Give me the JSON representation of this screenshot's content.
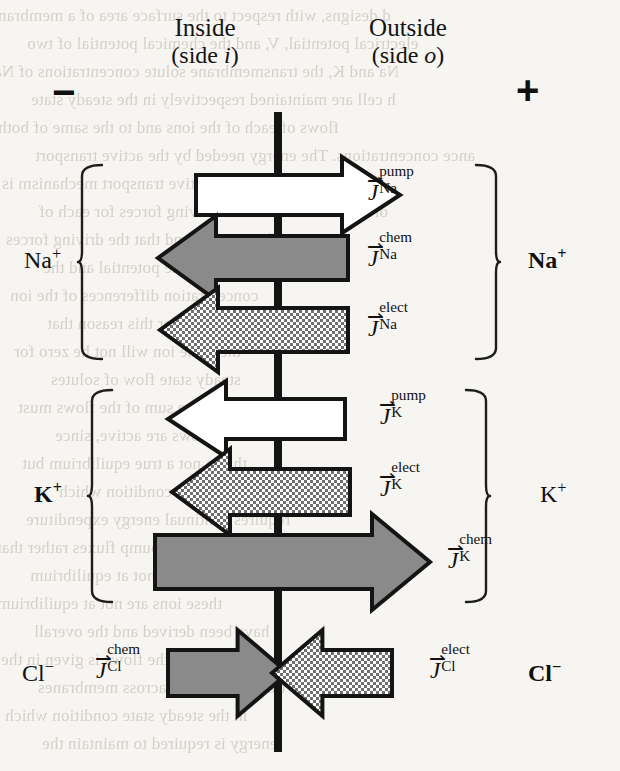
{
  "figure": {
    "type": "membrane-ion-flux-diagram",
    "membrane_color": "#141414",
    "arrow_outline_color": "#141414",
    "fill_pump": "#ffffff",
    "fill_chem": "#8a8a8a",
    "fill_elect": "#8a8a8a",
    "background": "#f7f5f1"
  },
  "header": {
    "inside": {
      "title": "Inside",
      "subtitle_pre": "(side ",
      "subtitle_italic": "i",
      "subtitle_post": ")"
    },
    "outside": {
      "title": "Outside",
      "subtitle_pre": "(side ",
      "subtitle_italic": "o",
      "subtitle_post": ")"
    },
    "inside_charge": "−",
    "outside_charge": "+"
  },
  "groups": [
    {
      "id": "sodium",
      "ion_left": "Na",
      "ion_left_charge": "+",
      "ion_left_bold": false,
      "ion_right": "Na",
      "ion_right_charge": "+",
      "ion_right_bold": true,
      "fluxes": [
        {
          "id": "na-pump",
          "symbol": "J",
          "superscript": "pump",
          "subscript": "Na",
          "style": "pump",
          "direction": "right"
        },
        {
          "id": "na-chem",
          "symbol": "J",
          "superscript": "chem",
          "subscript": "Na",
          "style": "chem",
          "direction": "left"
        },
        {
          "id": "na-elect",
          "symbol": "J",
          "superscript": "elect",
          "subscript": "Na",
          "style": "elect",
          "direction": "left"
        }
      ]
    },
    {
      "id": "potassium",
      "ion_left": "K",
      "ion_left_charge": "+",
      "ion_left_bold": true,
      "ion_right": "K",
      "ion_right_charge": "+",
      "ion_right_bold": false,
      "fluxes": [
        {
          "id": "k-pump",
          "symbol": "J",
          "superscript": "pump",
          "subscript": "K",
          "style": "pump",
          "direction": "left"
        },
        {
          "id": "k-elect",
          "symbol": "J",
          "superscript": "elect",
          "subscript": "K",
          "style": "elect",
          "direction": "left"
        },
        {
          "id": "k-chem",
          "symbol": "J",
          "superscript": "chem",
          "subscript": "K",
          "style": "chem",
          "direction": "right"
        }
      ]
    },
    {
      "id": "chloride",
      "ion_left": "Cl",
      "ion_left_charge": "−",
      "ion_left_bold": false,
      "ion_right": "Cl",
      "ion_right_charge": "−",
      "ion_right_bold": true,
      "fluxes": [
        {
          "id": "cl-chem",
          "symbol": "J",
          "superscript": "chem",
          "subscript": "Cl",
          "style": "chem",
          "direction": "right"
        },
        {
          "id": "cl-elect",
          "symbol": "J",
          "superscript": "elect",
          "subscript": "Cl",
          "style": "elect",
          "direction": "left"
        }
      ]
    }
  ],
  "vector_arrow_glyph": "⇀",
  "bleed_lines": [
    "d  designs,  with respect to the  surface  area  of a membrane",
    "electrical potential, V, and the chemical potential of two",
    "Na and K, the transmembrane solute concentrations of Na",
    "h cell are maintained respectively in the steady state",
    "flows of each of the ions and to the same of both",
    "ance concentrations. The energy needed by the active transport",
    "mechanism so that the active transport mechanism is",
    "ortant to realize that the driving forces for each of",
    "net flux is zero, and that the driving forces",
    "re the membrane potential and the",
    "concentration differences of the ion",
    "transport. It is for this reason that",
    "the same ion will not be zero for",
    "steady state flow of solutes",
    "the sum of the flows must",
    "some flows are active, since",
    "this is not a true equilibrium but",
    "a steady state condition which",
    "requires continual energy expenditure",
    "consider the pump fluxes rather than",
    "the system is not at equilibrium",
    "these ions are not at equilibrium",
    "have been derived and the overall",
    "sense of the flows is given in the",
    "transport of ions across membranes",
    "in the steady state condition which",
    "energy is required to maintain the"
  ]
}
